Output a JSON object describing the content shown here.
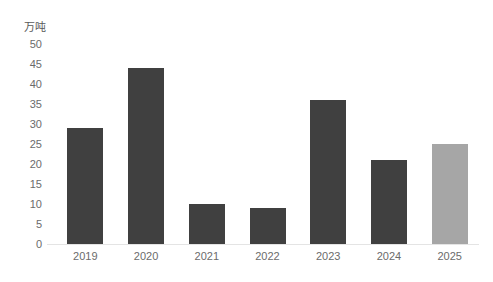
{
  "chart_data": {
    "type": "bar",
    "title": "",
    "subtitle": "",
    "xlabel": "",
    "ylabel": "万吨",
    "categories": [
      "2019",
      "2020",
      "2021",
      "2022",
      "2023",
      "2024",
      "2025"
    ],
    "values": [
      29,
      44,
      10,
      9,
      36,
      21,
      25
    ],
    "series": [
      {
        "name": "",
        "values": [
          29,
          44,
          10,
          9,
          36,
          21,
          25
        ]
      }
    ],
    "ylim": [
      0,
      50
    ],
    "ytick_labels": [
      "0",
      "5",
      "10",
      "15",
      "20",
      "25",
      "30",
      "35",
      "40",
      "45",
      "50"
    ],
    "ytick_values": [
      0,
      5,
      10,
      15,
      20,
      25,
      30,
      35,
      40,
      45,
      50
    ],
    "grid": false,
    "legend": "none",
    "bar_colors": [
      "#404040",
      "#404040",
      "#404040",
      "#404040",
      "#404040",
      "#404040",
      "#a6a6a6"
    ],
    "annotations": []
  },
  "colors": {
    "bar_primary": "#404040",
    "bar_forecast": "#a6a6a6",
    "axis_line": "#e4e4e4",
    "tick_text": "#6b6b6b",
    "title_text": "#595959",
    "background": "#ffffff"
  }
}
